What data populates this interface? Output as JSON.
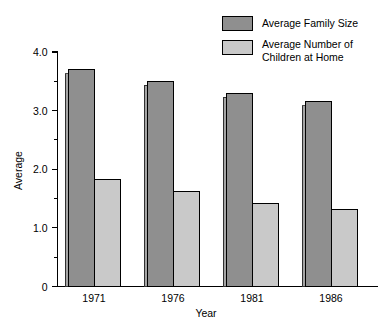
{
  "chart_data": {
    "type": "bar",
    "title": "",
    "subtitle": "",
    "xlabel": "Year",
    "ylabel": "Average",
    "categories": [
      "1971",
      "1976",
      "1981",
      "1986"
    ],
    "series": [
      {
        "name": "Average Family Size",
        "color": "#8f8f8f",
        "values": [
          3.7,
          3.5,
          3.3,
          3.15
        ]
      },
      {
        "name": "Average Number of Children at Home",
        "color": "#c9c9c9",
        "values": [
          1.82,
          1.62,
          1.42,
          1.32
        ]
      }
    ],
    "ylim": [
      0,
      4.0
    ],
    "y_tick_labels": [
      "4.0",
      "3.0",
      "2.0",
      "1.0",
      "0"
    ],
    "y_tick_values": [
      4.0,
      3.0,
      2.0,
      1.0,
      0
    ],
    "y_minor_tick_values": [
      3.5,
      2.5,
      1.5,
      0.5
    ],
    "grid": false,
    "legend_position": "top-right",
    "legend_entries": [
      {
        "label_line1": "Average Family Size",
        "label_line2": ""
      },
      {
        "label_line1": "Average Number of",
        "label_line2": "Children at Home"
      }
    ]
  },
  "colors": {
    "series_dark": "#8f8f8f",
    "series_light": "#c9c9c9",
    "axis": "#000000",
    "background": "#ffffff",
    "bar_outline": "#000000",
    "bar_shadow": "#a5a5a5"
  }
}
